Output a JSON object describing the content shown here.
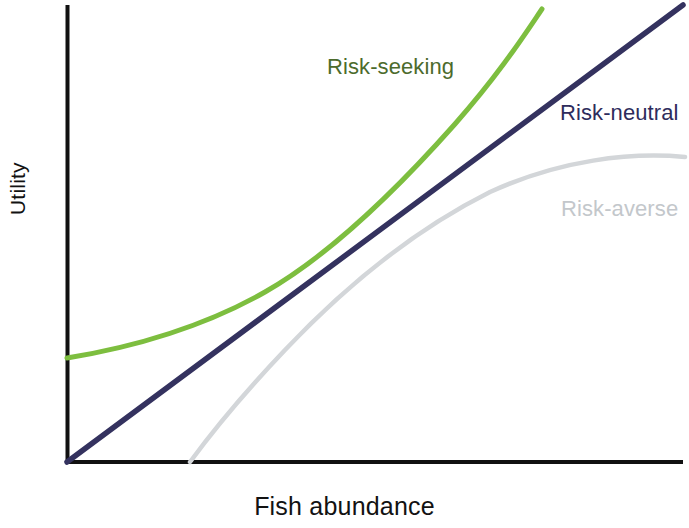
{
  "figure": {
    "width": 689,
    "height": 528,
    "background": "#ffffff"
  },
  "axes": {
    "x_label": "Fish abundance",
    "y_label": "Utility",
    "axis_color": "#111111",
    "x_axis_y_px": 462,
    "y_axis_x_px": 67,
    "ticks": false,
    "grid": false,
    "tick_labels_x": [],
    "tick_labels_y": []
  },
  "labels": {
    "risk_seeking": "Risk-seeking",
    "risk_neutral": "Risk-neutral",
    "risk_averse": "Risk-averse"
  },
  "colors": {
    "risk_seeking_curve": "#7dbe3f",
    "risk_seeking_text": "#4c6b2c",
    "risk_neutral_curve": "#34325f",
    "risk_neutral_text": "#2e2c5c",
    "risk_averse_curve": "#d3d6d9",
    "risk_averse_text": "#c3c7cb",
    "axis": "#111111"
  },
  "paths": {
    "risk_seeking": "M 67 358 C 140 346, 205 326, 265 292 C 330 255, 400 186, 455 124 C 500 73, 525 34, 542 9",
    "risk_neutral": "M 67 462 L 683 5",
    "risk_averse": "M 190 462 C 215 428, 245 392, 285 350 C 340 292, 410 232, 490 192 C 560 160, 630 152, 685 157"
  },
  "chart_data": {
    "type": "line",
    "title": "",
    "subtitle": "",
    "xlabel": "Fish abundance",
    "ylabel": "Utility",
    "xlim": [
      0,
      1
    ],
    "ylim": [
      0,
      1
    ],
    "grid": false,
    "axis_ticks": false,
    "legend_position": "inline-annotations",
    "x": [
      0,
      0.1,
      0.2,
      0.3,
      0.4,
      0.5,
      0.6,
      0.7,
      0.8,
      0.9,
      1.0
    ],
    "series": [
      {
        "name": "Risk-seeking",
        "color": "#7dbe3f",
        "label_color": "#4c6b2c",
        "shape": "convex",
        "x": [
          0.0,
          0.09,
          0.19,
          0.32,
          0.43,
          0.55,
          0.65,
          0.74,
          0.81
        ],
        "values": [
          0.23,
          0.26,
          0.3,
          0.37,
          0.46,
          0.56,
          0.68,
          0.79,
          0.99
        ],
        "annotation": "Risk-seeking",
        "annotation_x": 0.42,
        "annotation_y": 0.88
      },
      {
        "name": "Risk-neutral",
        "color": "#34325f",
        "label_color": "#2e2c5c",
        "shape": "linear",
        "x": [
          0.0,
          0.25,
          0.5,
          0.75,
          1.0
        ],
        "values": [
          0.0,
          0.25,
          0.5,
          0.75,
          1.0
        ],
        "annotation": "Risk-neutral",
        "annotation_x": 0.8,
        "annotation_y": 0.76
      },
      {
        "name": "Risk-averse",
        "color": "#d3d6d9",
        "label_color": "#c3c7cb",
        "shape": "concave",
        "x": [
          0.2,
          0.28,
          0.35,
          0.45,
          0.6,
          0.72,
          0.85,
          1.0
        ],
        "values": [
          0.0,
          0.1,
          0.2,
          0.32,
          0.47,
          0.57,
          0.64,
          0.67
        ],
        "annotation": "Risk-averse",
        "annotation_x": 0.8,
        "annotation_y": 0.55
      }
    ]
  }
}
